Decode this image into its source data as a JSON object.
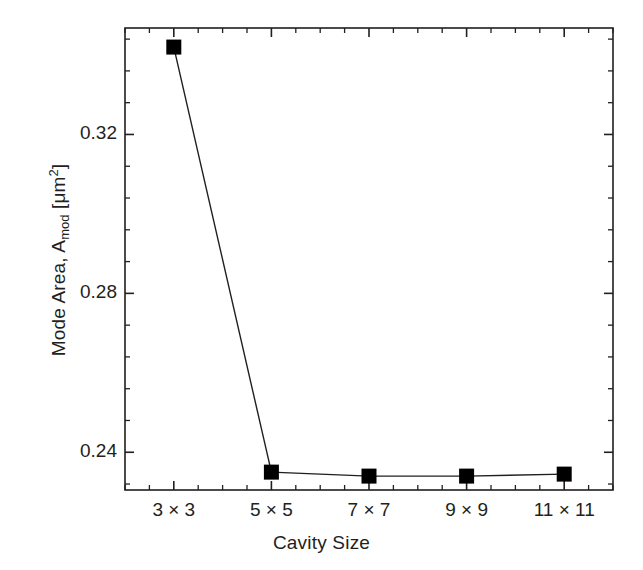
{
  "chart_data": {
    "type": "line",
    "title": "",
    "subtitle": "",
    "xlabel": "Cavity Size",
    "ylabel": "Mode Area, A_mod [μm²]",
    "ylabel_parts": {
      "prefix": "Mode Area, A",
      "subscript": "mod",
      "middle": " [μm",
      "superscript": "2",
      "suffix": "]"
    },
    "categories": [
      "3 × 3",
      "5 × 5",
      "7 × 7",
      "9 × 9",
      "11 × 11"
    ],
    "x": [
      3,
      5,
      7,
      9,
      11
    ],
    "values": [
      0.342,
      0.235,
      0.234,
      0.234,
      0.2345
    ],
    "series": [
      {
        "name": "Mode Area",
        "values": [
          0.342,
          0.235,
          0.234,
          0.234,
          0.2345
        ],
        "marker": "filled-square",
        "marker_color": "#000000",
        "line_color": "#231f20",
        "line_width": 1.4
      }
    ],
    "xlim": [
      2.0,
      12.0
    ],
    "ylim": [
      0.2305,
      0.3468
    ],
    "ytick_labels": [
      "0.32",
      "0.28",
      "0.24"
    ],
    "ytick_values": [
      0.32,
      0.28,
      0.24
    ],
    "yminor_step": 0.008,
    "xtick_labels": [
      "3 × 3",
      "5 × 5",
      "7 × 7",
      "9 × 9",
      "11 × 11"
    ],
    "xtick_values": [
      3,
      5,
      7,
      9,
      11
    ],
    "xminor_count_between": 3,
    "grid": false,
    "legend": false,
    "legend_position": "none",
    "frame": "box",
    "tick_direction": "in",
    "background_color": "#ffffff",
    "axis_color": "#231f20"
  },
  "figure": {
    "width": 643,
    "height": 570,
    "plot_area": {
      "left": 125,
      "top": 28,
      "right": 613,
      "bottom": 490
    }
  }
}
